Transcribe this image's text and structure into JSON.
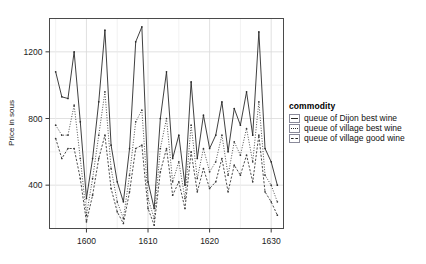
{
  "chart_data": {
    "type": "line",
    "title": "",
    "xlabel": "",
    "ylabel": "Price in sous",
    "xlim": [
      1594,
      1632
    ],
    "ylim": [
      140,
      1400
    ],
    "xticks": [
      1600,
      1610,
      1620,
      1630
    ],
    "xtick_labels": [
      "1600",
      "1610",
      "1620",
      "1630"
    ],
    "yticks": [
      400,
      800,
      1200
    ],
    "ytick_labels": [
      "400",
      "800",
      "1200"
    ],
    "grid": true,
    "legend_position": "right",
    "legend_title": "commodity",
    "markers": "point",
    "x": [
      1595,
      1596,
      1597,
      1598,
      1599,
      1600,
      1601,
      1602,
      1603,
      1604,
      1605,
      1606,
      1607,
      1608,
      1609,
      1610,
      1611,
      1612,
      1613,
      1614,
      1615,
      1616,
      1617,
      1618,
      1619,
      1620,
      1621,
      1622,
      1623,
      1624,
      1625,
      1626,
      1627,
      1628,
      1629,
      1630,
      1631
    ],
    "series": [
      {
        "name": "queue of Dijon best wine",
        "style": "solid",
        "color": "#2a2a2a",
        "values": [
          1080,
          930,
          920,
          1200,
          780,
          320,
          560,
          900,
          1330,
          640,
          420,
          300,
          620,
          1260,
          1350,
          420,
          260,
          800,
          1080,
          560,
          700,
          400,
          1020,
          560,
          820,
          620,
          700,
          900,
          600,
          860,
          760,
          960,
          700,
          1320,
          620,
          540,
          400
        ]
      },
      {
        "name": "queue of village best wine",
        "style": "dotted",
        "color": "#3a3a3a",
        "values": [
          760,
          700,
          700,
          880,
          560,
          220,
          440,
          700,
          960,
          500,
          300,
          200,
          460,
          780,
          850,
          320,
          200,
          620,
          800,
          420,
          540,
          320,
          760,
          440,
          620,
          480,
          540,
          700,
          460,
          660,
          580,
          740,
          540,
          900,
          460,
          400,
          300
        ]
      },
      {
        "name": "queue of village good wine",
        "style": "dashed",
        "color": "#3a3a3a",
        "values": [
          680,
          560,
          620,
          620,
          440,
          180,
          340,
          560,
          700,
          380,
          240,
          170,
          360,
          620,
          640,
          260,
          160,
          480,
          620,
          340,
          420,
          260,
          600,
          360,
          500,
          380,
          420,
          560,
          360,
          520,
          460,
          580,
          420,
          700,
          360,
          300,
          220
        ]
      }
    ]
  }
}
